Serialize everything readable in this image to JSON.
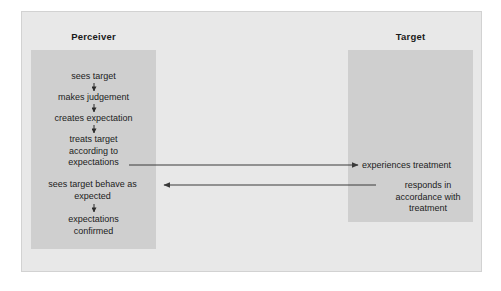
{
  "diagram": {
    "columns": {
      "perceiver": {
        "title": "Perceiver",
        "steps": [
          {
            "id": "sees-target",
            "label": "sees target"
          },
          {
            "id": "makes-judgement",
            "label": "makes judgement"
          },
          {
            "id": "creates-expectation",
            "label": "creates expectation"
          },
          {
            "id": "treats-target",
            "label": "treats target\naccording to\nexpectations"
          },
          {
            "id": "sees-target-behave",
            "label": "sees target behave as\nexpected"
          },
          {
            "id": "expectations-confirmed",
            "label": "expectations\nconfirmed"
          }
        ]
      },
      "target": {
        "title": "Target",
        "steps": [
          {
            "id": "experiences-treatment",
            "label": "experiences treatment"
          },
          {
            "id": "responds-in-accordance",
            "label": "responds in\naccordance with\ntreatment"
          }
        ]
      }
    },
    "connectors": [
      {
        "id": "treatment-arrow",
        "from": "treats target according to expectations",
        "to": "experiences treatment",
        "direction": "right"
      },
      {
        "id": "response-arrow",
        "from": "responds in accordance with treatment",
        "to": "sees target behave as expected",
        "direction": "left"
      },
      {
        "id": "step-arrow-1",
        "from": "sees target",
        "to": "makes judgement",
        "direction": "down"
      },
      {
        "id": "step-arrow-2",
        "from": "makes judgement",
        "to": "creates expectation",
        "direction": "down"
      },
      {
        "id": "step-arrow-3",
        "from": "creates expectation",
        "to": "treats target according to expectations",
        "direction": "down"
      },
      {
        "id": "step-arrow-4",
        "from": "expected",
        "to": "expectations confirmed",
        "direction": "down"
      }
    ],
    "colors": {
      "panel_background": "#e8e8e8",
      "column_box": "#cfcfcf",
      "text": "#1c1c1c",
      "connector": "#3a3a3a"
    }
  }
}
